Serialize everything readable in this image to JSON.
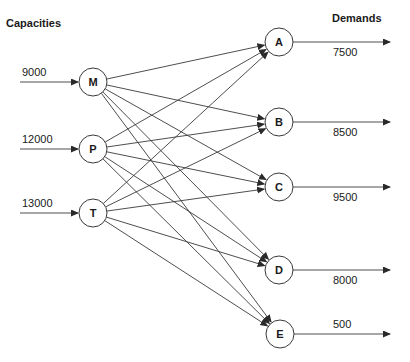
{
  "diagram": {
    "type": "transportation-network",
    "left_header": "Capacities",
    "right_header": "Demands",
    "sources": [
      {
        "id": "M",
        "capacity": "9000",
        "x": 93,
        "y": 82
      },
      {
        "id": "P",
        "capacity": "12000",
        "x": 93,
        "y": 149
      },
      {
        "id": "T",
        "capacity": "13000",
        "x": 93,
        "y": 213
      }
    ],
    "destinations": [
      {
        "id": "A",
        "demand": "7500",
        "x": 279,
        "y": 42
      },
      {
        "id": "B",
        "demand": "8500",
        "x": 279,
        "y": 122
      },
      {
        "id": "C",
        "demand": "9500",
        "x": 279,
        "y": 187
      },
      {
        "id": "D",
        "demand": "8000",
        "x": 279,
        "y": 270
      },
      {
        "id": "E",
        "demand": "500",
        "x": 280,
        "y": 334
      }
    ],
    "edges": "complete bipartite: every source (M, P, T) connects to every destination (A, B, C, D, E)"
  }
}
